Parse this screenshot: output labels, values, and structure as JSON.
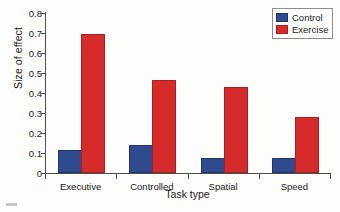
{
  "chart_data": {
    "type": "bar",
    "title": "",
    "xlabel": "Task type",
    "ylabel": "Size of effect",
    "categories": [
      "Executive",
      "Controlled",
      "Spatial",
      "Speed"
    ],
    "series": [
      {
        "name": "Control",
        "color": "#2f4b8e",
        "values": [
          0.105,
          0.13,
          0.065,
          0.065
        ]
      },
      {
        "name": "Exercise",
        "color": "#d52b2b",
        "values": [
          0.685,
          0.455,
          0.42,
          0.27
        ]
      }
    ],
    "ylim": [
      0,
      0.8
    ],
    "ytick_labels": [
      "0.8",
      "0.7",
      "0.6",
      "0.5",
      "0.4",
      "0.3",
      "0.2",
      "0.1",
      "0"
    ],
    "ytick_values": [
      0.8,
      0.7,
      0.6,
      0.5,
      0.4,
      0.3,
      0.2,
      0.1,
      0
    ],
    "grid": false,
    "legend_position": "top-right",
    "legend_entries": [
      "Control",
      "Exercise"
    ]
  },
  "axes": {
    "y_title": "Size of effect",
    "x_title": "Task type"
  },
  "legend": {
    "control_label": "Control",
    "exercise_label": "Exercise"
  }
}
